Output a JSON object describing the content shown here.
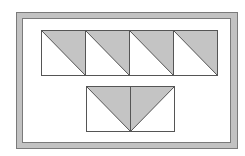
{
  "diagram": {
    "colors": {
      "background": "#ffffff",
      "frame_fill": "#c2c2c2",
      "frame_stroke": "#7a7a7a",
      "triangle_fill": "#c4c4c4",
      "line": "#555555"
    },
    "top_row": {
      "count": 4,
      "squares": [
        {
          "orientation": "top-right-shaded"
        },
        {
          "orientation": "top-right-shaded"
        },
        {
          "orientation": "top-right-shaded"
        },
        {
          "orientation": "top-right-shaded"
        }
      ]
    },
    "bottom_row": {
      "count": 2,
      "squares": [
        {
          "orientation": "top-right-shaded"
        },
        {
          "orientation": "top-left-shaded"
        }
      ]
    }
  }
}
